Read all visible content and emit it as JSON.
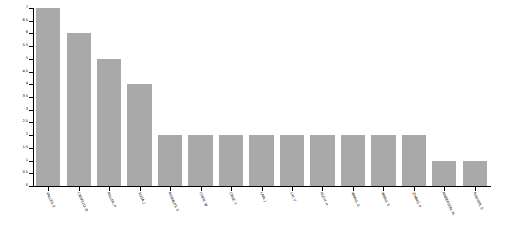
{
  "chart_data": {
    "type": "bar",
    "title": "",
    "xlabel": "",
    "ylabel": "",
    "ylim": [
      0,
      7
    ],
    "grid": false,
    "legend": null,
    "bar_color": "#a9a9a9",
    "background_color": "#ffffff",
    "axis_color": "#000000",
    "xtick_rotation": 65,
    "categories": [
      "VALLES, E",
      "CASTILLO, D",
      "MILLER, P",
      "SOSA, J",
      "MORALES, S",
      "CHEN, W",
      "CRUZ, Y",
      "LAM, J",
      "LIU, V",
      "KOCH, H",
      "WANG, G",
      "WANG, T",
      "ZHANG, P",
      "ANDERSON, M",
      "NGUYEN, S"
    ],
    "values": [
      7,
      6,
      5,
      4,
      2,
      2,
      2,
      2,
      2,
      2,
      2,
      2,
      2,
      1,
      1
    ],
    "yticks": [
      0,
      0.5,
      1,
      1.5,
      2,
      2.5,
      3,
      3.5,
      4,
      4.5,
      5,
      5.5,
      6,
      6.5,
      7
    ],
    "ytick_labels": [
      "0",
      "0.5",
      "1",
      "1.5",
      "2",
      "2.5",
      "3",
      "3.5",
      "4",
      "4.5",
      "5",
      "5.5",
      "6",
      "6.5",
      "7"
    ]
  }
}
